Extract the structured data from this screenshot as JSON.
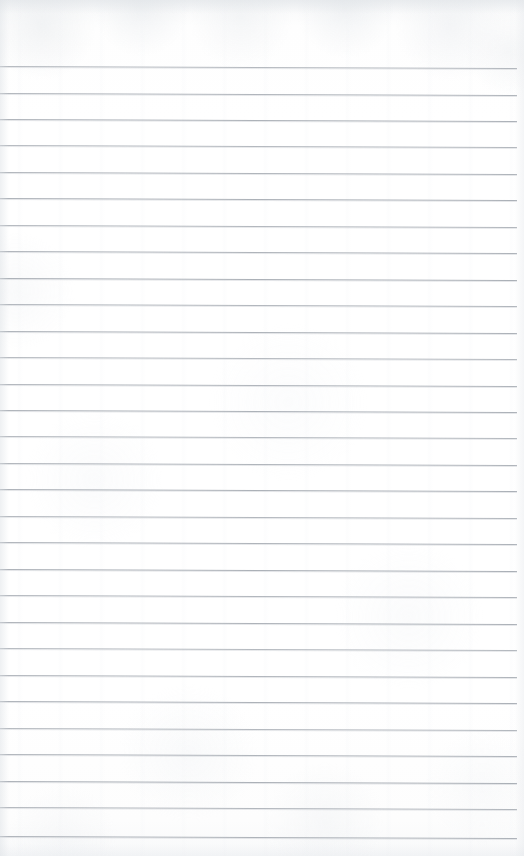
{
  "document": {
    "type": "scanned-lined-notepad-page",
    "title": "Blank Ruled Notepad Page",
    "content_text": "",
    "width_px": 524,
    "height_px": 856
  },
  "paper": {
    "background_color": "#fdfdfd",
    "base_tone": "#ffffff",
    "top_shade_color": "#f7f8f9",
    "bottom_shade_color": "#f8f9fa",
    "edge_shadow_color": "#dee2e6",
    "texture": "subtle-scan-grain"
  },
  "ruling": {
    "line_color": "#9ba1a9",
    "line_secondary_color": "#babfc6",
    "line_thickness_px": 1,
    "line_count": 30,
    "first_line_y": 66,
    "line_spacing_px": 26.5,
    "line_left_x": 0,
    "line_right_x": 517,
    "slant_degrees": 0.22,
    "top_margin_px": 66,
    "bottom_margin_px": 20,
    "right_margin_px": 7
  },
  "lines": [
    {
      "index": 1,
      "y": 66,
      "text": ""
    },
    {
      "index": 2,
      "y": 93,
      "text": ""
    },
    {
      "index": 3,
      "y": 119,
      "text": ""
    },
    {
      "index": 4,
      "y": 145,
      "text": ""
    },
    {
      "index": 5,
      "y": 172,
      "text": ""
    },
    {
      "index": 6,
      "y": 198,
      "text": ""
    },
    {
      "index": 7,
      "y": 225,
      "text": ""
    },
    {
      "index": 8,
      "y": 251,
      "text": ""
    },
    {
      "index": 9,
      "y": 278,
      "text": ""
    },
    {
      "index": 10,
      "y": 304,
      "text": ""
    },
    {
      "index": 11,
      "y": 331,
      "text": ""
    },
    {
      "index": 12,
      "y": 357,
      "text": ""
    },
    {
      "index": 13,
      "y": 384,
      "text": ""
    },
    {
      "index": 14,
      "y": 410,
      "text": ""
    },
    {
      "index": 15,
      "y": 436,
      "text": ""
    },
    {
      "index": 16,
      "y": 463,
      "text": ""
    },
    {
      "index": 17,
      "y": 489,
      "text": ""
    },
    {
      "index": 18,
      "y": 516,
      "text": ""
    },
    {
      "index": 19,
      "y": 542,
      "text": ""
    },
    {
      "index": 20,
      "y": 569,
      "text": ""
    },
    {
      "index": 21,
      "y": 595,
      "text": ""
    },
    {
      "index": 22,
      "y": 622,
      "text": ""
    },
    {
      "index": 23,
      "y": 648,
      "text": ""
    },
    {
      "index": 24,
      "y": 675,
      "text": ""
    },
    {
      "index": 25,
      "y": 701,
      "text": ""
    },
    {
      "index": 26,
      "y": 728,
      "text": ""
    },
    {
      "index": 27,
      "y": 754,
      "text": ""
    },
    {
      "index": 28,
      "y": 781,
      "text": ""
    },
    {
      "index": 29,
      "y": 807,
      "text": ""
    },
    {
      "index": 30,
      "y": 836,
      "text": ""
    }
  ]
}
